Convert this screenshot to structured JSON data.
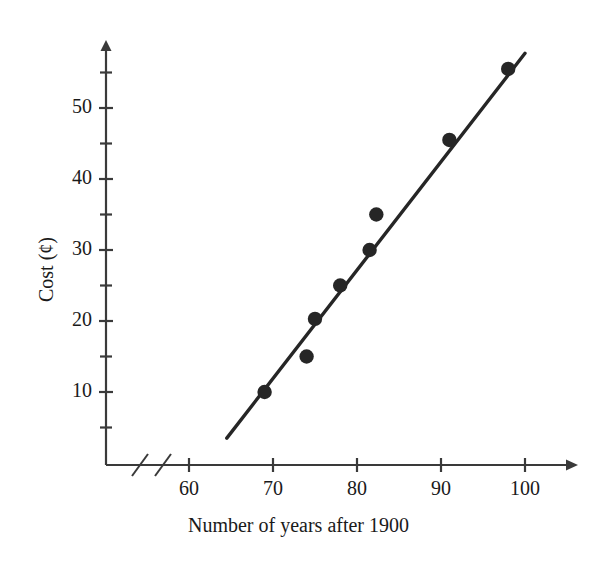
{
  "chart_data": {
    "type": "scatter",
    "title": "",
    "xlabel": "Number of years after 1900",
    "ylabel": "Cost (¢)",
    "xlim": [
      55,
      104
    ],
    "ylim": [
      0,
      59
    ],
    "grid": false,
    "legend": null,
    "axis_break": true,
    "x_ticks": [
      60,
      70,
      80,
      90,
      100
    ],
    "x_tick_labels": [
      "60",
      "70",
      "80",
      "90",
      "100"
    ],
    "y_ticks": [
      10,
      20,
      30,
      40,
      50
    ],
    "y_tick_labels": [
      "10",
      "20",
      "30",
      "40",
      "50"
    ],
    "y_minor_ticks": [
      5,
      15,
      25,
      35,
      45,
      55
    ],
    "points": [
      {
        "x": 69,
        "y": 10
      },
      {
        "x": 74,
        "y": 15
      },
      {
        "x": 75,
        "y": 20.3
      },
      {
        "x": 78,
        "y": 25
      },
      {
        "x": 81.5,
        "y": 30
      },
      {
        "x": 82.3,
        "y": 35
      },
      {
        "x": 91,
        "y": 45.5
      },
      {
        "x": 98,
        "y": 55.5
      }
    ],
    "trend_line": {
      "x_start": 64.5,
      "y_start": 3.5,
      "x_end": 100.0,
      "y_end": 57.7
    },
    "marker_color": "#262626",
    "line_color": "#262626",
    "axis_color": "#3a3a3a",
    "background_color": "#ffffff"
  },
  "axis_titles": {
    "x": "Number of years after 1900",
    "y": "Cost (¢)"
  }
}
